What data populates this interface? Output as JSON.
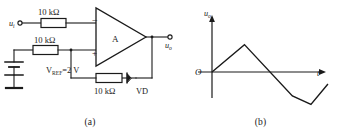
{
  "figure": {
    "panels": [
      {
        "id": "circuit",
        "caption": "(a)",
        "title": "Inverting op-amp comparator with diode feedback"
      },
      {
        "id": "waveform",
        "caption": "(b)",
        "title": "Output voltage waveform"
      }
    ]
  },
  "circuit": {
    "input_terminal_label": "u",
    "input_terminal_sub": "i",
    "output_terminal_label": "u",
    "output_terminal_sub": "o",
    "amplifier_label": "A",
    "inverting_input_symbol": "−",
    "noninverting_input_symbol": "+",
    "resistor_input": "10 kΩ",
    "resistor_reference": "10 kΩ",
    "resistor_feedback": "10 kΩ",
    "reference_source_label": "V",
    "reference_source_sub": "REF",
    "reference_source_value": "=2 V",
    "diode_label": "VD",
    "wire_color": "#1a1a1a"
  },
  "waveform": {
    "y_axis_label": "u",
    "y_axis_sub": "o",
    "x_axis_label": "t",
    "origin_label": "O"
  },
  "chart_data": {
    "type": "line",
    "xlabel": "t",
    "ylabel": "uo",
    "grid": false,
    "legend": null,
    "xlim": [
      0,
      150
    ],
    "ylim": [
      -40,
      40
    ],
    "series": [
      {
        "name": "uo",
        "x": [
          0,
          42,
          104,
          128,
          150
        ],
        "y": [
          0,
          32,
          -28,
          -38,
          -14
        ]
      }
    ],
    "annotations": [
      "O at origin",
      "triangular wave rising then falling then partial rise"
    ]
  }
}
